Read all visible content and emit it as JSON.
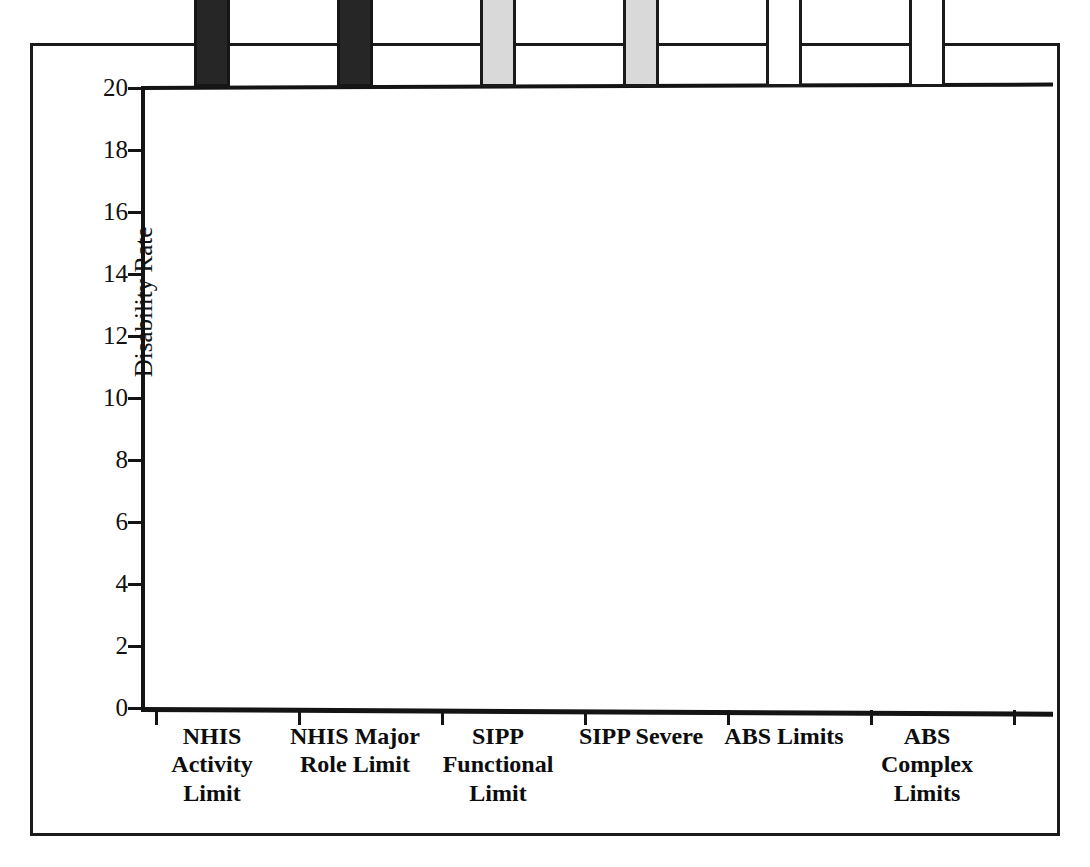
{
  "chart_data": {
    "type": "bar",
    "title": "",
    "xlabel": "",
    "ylabel": "Disability Rate",
    "ylim": [
      0,
      20
    ],
    "yticks": [
      0,
      2,
      4,
      6,
      8,
      10,
      12,
      14,
      16,
      18,
      20
    ],
    "ytick_labels": [
      "0",
      "2",
      "4",
      "6",
      "8",
      "10",
      "12",
      "14",
      "16",
      "18",
      "20"
    ],
    "grid": false,
    "legend": "none",
    "categories": [
      "NHIS Activity Limit",
      "NHIS Major Role Limit",
      "SIPP Functional Limit",
      "SIPP Severe",
      "ABS Limits",
      "ABS Complex Limits"
    ],
    "category_lines": [
      [
        "NHIS",
        "Activity",
        "Limit"
      ],
      [
        "NHIS Major",
        "Role Limit"
      ],
      [
        "SIPP",
        "Functional",
        "Limit"
      ],
      [
        "SIPP Severe"
      ],
      [
        "ABS Limits"
      ],
      [
        "ABS",
        "Complex",
        "Limits"
      ]
    ],
    "values": [
      15.1,
      10.5,
      15.5,
      10.1,
      18.2,
      14.4
    ],
    "bar_styles": [
      "dark",
      "dark",
      "light",
      "light",
      "open",
      "open"
    ],
    "colors": {
      "dark_fill": "#262626",
      "light_fill": "#d9d9d9",
      "open_fill": "#ffffff",
      "outline": "#1a1a1a",
      "axis": "#141414",
      "text": "#111111"
    }
  }
}
